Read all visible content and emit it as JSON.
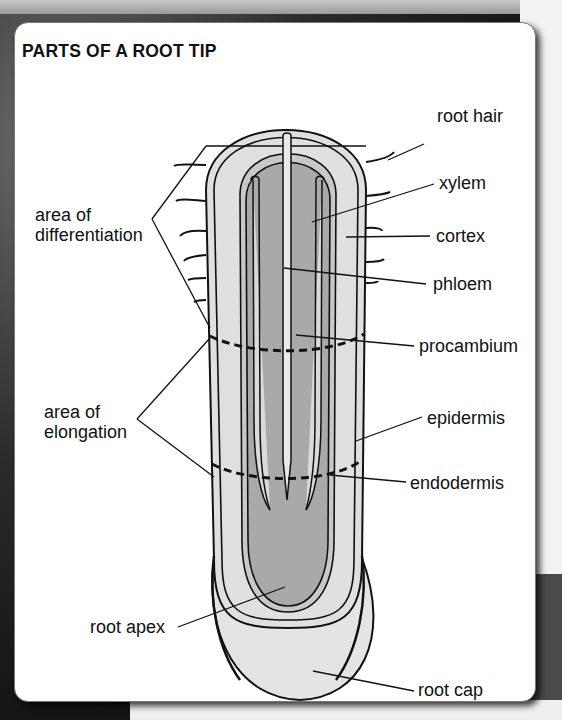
{
  "title": "PARTS OF A ROOT TIP",
  "labels": {
    "root_hair": "root hair",
    "xylem": "xylem",
    "cortex": "cortex",
    "phloem": "phloem",
    "procambium": "procambium",
    "epidermis": "epidermis",
    "endodermis": "endodermis",
    "root_cap": "root cap",
    "root_apex": "root apex",
    "area_diff_line1": "area of",
    "area_diff_line2": "differentiation",
    "area_elong_line1": "area of",
    "area_elong_line2": "elongation"
  },
  "colors": {
    "outer_tissue": "#e0e0e0",
    "inner_tissue": "#a9a9a9",
    "outline": "#111111",
    "card": "#ffffff"
  }
}
